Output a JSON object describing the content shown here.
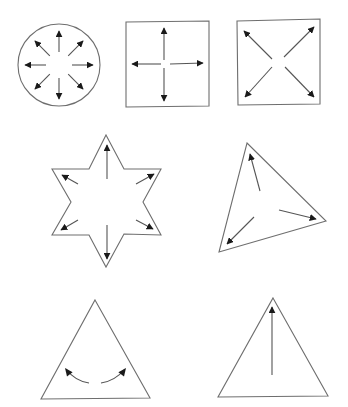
{
  "figure": {
    "colors": {
      "outline": "#6e6e6e",
      "arrow": "#1a1a1a",
      "background": "#ffffff"
    },
    "shapes": [
      {
        "id": "circle",
        "type": "circle",
        "center": [
          59,
          65
        ],
        "radius": 41,
        "arrows": {
          "count": 8,
          "inner_radius": 13,
          "outer_radius": 34,
          "angles_deg": [
            0,
            45,
            90,
            135,
            180,
            225,
            270,
            315
          ]
        }
      },
      {
        "id": "square-axis",
        "type": "square",
        "points": [
          [
            126,
            22
          ],
          [
            209,
            21
          ],
          [
            209,
            106
          ],
          [
            126,
            107
          ]
        ],
        "arrows": [
          {
            "from": [
              164,
              60
            ],
            "to": [
              164,
              28
            ]
          },
          {
            "from": [
              164,
              68
            ],
            "to": [
              164,
              101
            ]
          },
          {
            "from": [
              161,
              64
            ],
            "to": [
              132,
              64
            ]
          },
          {
            "from": [
              170,
              64
            ],
            "to": [
              203,
              63
            ]
          }
        ]
      },
      {
        "id": "square-diagonal",
        "type": "square",
        "points": [
          [
            237,
            21
          ],
          [
            320,
            19
          ],
          [
            320,
            104
          ],
          [
            238,
            105
          ]
        ],
        "arrows": [
          {
            "from": [
              272,
              59
            ],
            "to": [
              244,
              31
            ]
          },
          {
            "from": [
              284,
              57
            ],
            "to": [
              314,
              27
            ]
          },
          {
            "from": [
              272,
              67
            ],
            "to": [
              245,
              97
            ]
          },
          {
            "from": [
              285,
              67
            ],
            "to": [
              314,
              97
            ]
          }
        ]
      },
      {
        "id": "hexagram",
        "type": "star",
        "points": [
          [
            106,
            135
          ],
          [
            124,
            169
          ],
          [
            161,
            169
          ],
          [
            143,
            202
          ],
          [
            161,
            235
          ],
          [
            124,
            234
          ],
          [
            106,
            267
          ],
          [
            89,
            235
          ],
          [
            52,
            235
          ],
          [
            71,
            202
          ],
          [
            52,
            169
          ],
          [
            89,
            169
          ]
        ],
        "arrows": [
          {
            "from": [
              107,
              179
            ],
            "to": [
              107,
              145
            ]
          },
          {
            "from": [
              107,
              225
            ],
            "to": [
              107,
              259
            ]
          },
          {
            "from": [
              78,
              184
            ],
            "to": [
              62,
              175
            ]
          },
          {
            "from": [
              136,
              184
            ],
            "to": [
              154,
              174
            ]
          },
          {
            "from": [
              78,
              220
            ],
            "to": [
              61,
              230
            ]
          },
          {
            "from": [
              136,
              220
            ],
            "to": [
              153,
              229
            ]
          }
        ]
      },
      {
        "id": "rotated-triangle",
        "type": "triangle",
        "points": [
          [
            247,
            143
          ],
          [
            326,
            221
          ],
          [
            219,
            252
          ]
        ],
        "arrows": [
          {
            "from": [
              260,
              191
            ],
            "to": [
              250,
              154
            ]
          },
          {
            "from": [
              279,
              210
            ],
            "to": [
              316,
              219
            ]
          },
          {
            "from": [
              254,
              217
            ],
            "to": [
              227,
              244
            ]
          }
        ]
      },
      {
        "id": "triangle-rotation",
        "type": "triangle",
        "points": [
          [
            95,
            300
          ],
          [
            150,
            398
          ],
          [
            41,
            399
          ]
        ],
        "curved_arrows": [
          {
            "path": "M 89 383 Q 75 381 66 369",
            "tip": [
              65,
              368
            ],
            "dir": [
              -0.6,
              -0.8
            ]
          },
          {
            "path": "M 101 383 Q 115 381 125 369",
            "tip": [
              126,
              368
            ],
            "dir": [
              0.6,
              -0.8
            ]
          }
        ]
      },
      {
        "id": "triangle-reflection",
        "type": "triangle",
        "points": [
          [
            273,
            298
          ],
          [
            328,
            396
          ],
          [
            218,
            397
          ]
        ],
        "arrows": [
          {
            "from": [
              272,
              375
            ],
            "to": [
              272,
              307
            ]
          }
        ]
      }
    ]
  }
}
